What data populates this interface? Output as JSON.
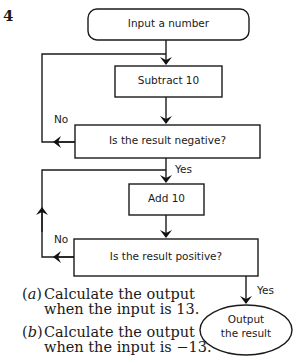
{
  "question_number": "4",
  "flowchart": {
    "nodes": [
      {
        "id": "start",
        "shape": "rounded-rect",
        "label": "Input a number"
      },
      {
        "id": "subtract",
        "shape": "rect",
        "label": "Subtract 10"
      },
      {
        "id": "check_negative",
        "shape": "rect",
        "label": "Is the result negative?"
      },
      {
        "id": "add",
        "shape": "rect",
        "label": "Add 10"
      },
      {
        "id": "check_positive",
        "shape": "rect",
        "label": "Is the result positive?"
      },
      {
        "id": "output",
        "shape": "ellipse",
        "label_line1": "Output",
        "label_line2": "the result"
      }
    ],
    "edges": [
      {
        "from": "start",
        "to": "subtract",
        "label": ""
      },
      {
        "from": "subtract",
        "to": "check_negative",
        "label": ""
      },
      {
        "from": "check_negative",
        "to": "subtract",
        "label": "No"
      },
      {
        "from": "check_negative",
        "to": "add",
        "label": "Yes"
      },
      {
        "from": "add",
        "to": "check_positive",
        "label": ""
      },
      {
        "from": "check_positive",
        "to": "add",
        "label": "No"
      },
      {
        "from": "check_positive",
        "to": "output",
        "label": "Yes"
      }
    ],
    "labels": {
      "no_1": "No",
      "yes_1": "Yes",
      "no_2": "No",
      "yes_2": "Yes"
    }
  },
  "questions": [
    {
      "tag_open": "(",
      "tag_letter": "a",
      "tag_close": ")",
      "line1": "Calculate the output",
      "line2": "when the input is 13."
    },
    {
      "tag_open": "(",
      "tag_letter": "b",
      "tag_close": ")",
      "line1": "Calculate the output",
      "line2": "when the input is −13."
    }
  ]
}
